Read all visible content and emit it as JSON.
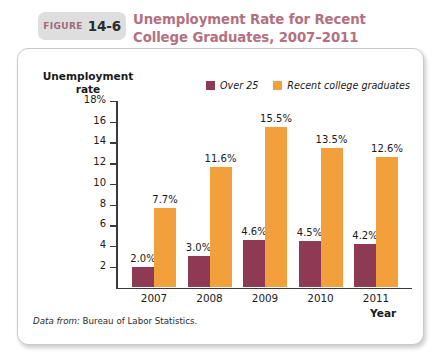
{
  "figure": {
    "label": "FIGURE",
    "number": "14-6",
    "title": "Unemployment Rate for Recent College Graduates, 2007–2011",
    "title_color": "#b5707f",
    "tab_bg": "#dedede"
  },
  "source": {
    "prefix": "Data from:",
    "text": "Bureau of Labor Statistics."
  },
  "legend": {
    "items": [
      {
        "label": "Over 25",
        "color": "#8e3a54"
      },
      {
        "label": "Recent college graduates",
        "color": "#f2a03c"
      }
    ]
  },
  "axes": {
    "y_title": "Unemployment rate",
    "x_title": "Year",
    "y_ticks": [
      "18%",
      "16",
      "14",
      "12",
      "10",
      "8",
      "6",
      "4",
      "2"
    ],
    "y_tick_values": [
      18,
      16,
      14,
      12,
      10,
      8,
      6,
      4,
      2
    ]
  },
  "chart_data": {
    "type": "bar",
    "title": "Unemployment Rate for Recent College Graduates, 2007–2011",
    "xlabel": "Year",
    "ylabel": "Unemployment rate",
    "ylim": [
      0,
      18
    ],
    "ytick_labels": [
      "18%",
      "16",
      "14",
      "12",
      "10",
      "8",
      "6",
      "4",
      "2"
    ],
    "grid": false,
    "legend_position": "top-center",
    "categories": [
      "2007",
      "2008",
      "2009",
      "2010",
      "2011"
    ],
    "series": [
      {
        "name": "Over 25",
        "color": "#8e3a54",
        "values": [
          2.0,
          3.0,
          4.6,
          4.5,
          4.2
        ],
        "labels": [
          "2.0%",
          "3.0%",
          "4.6%",
          "4.5%",
          "4.2%"
        ]
      },
      {
        "name": "Recent college graduates",
        "color": "#f2a03c",
        "values": [
          7.7,
          11.6,
          15.5,
          13.5,
          12.6
        ],
        "labels": [
          "7.7%",
          "11.6%",
          "15.5%",
          "13.5%",
          "12.6%"
        ]
      }
    ],
    "source": "Data from: Bureau of Labor Statistics."
  }
}
